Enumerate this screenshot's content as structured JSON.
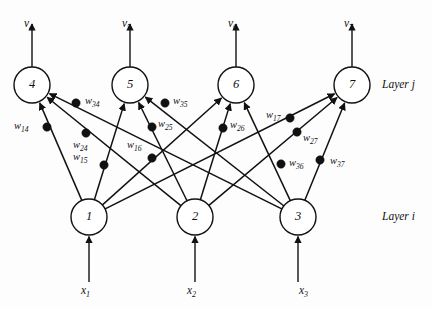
{
  "diagram": {
    "layers": [
      {
        "id": "layer-j",
        "label": "Layer j",
        "x": 382,
        "y": 78
      },
      {
        "id": "layer-i",
        "label": "Layer i",
        "x": 382,
        "y": 210
      }
    ],
    "nodes": [
      {
        "id": "n1",
        "label": "1",
        "cx": 89,
        "cy": 217,
        "r": 18,
        "layer": "i"
      },
      {
        "id": "n2",
        "label": "2",
        "cx": 195,
        "cy": 217,
        "r": 18,
        "layer": "i"
      },
      {
        "id": "n3",
        "label": "3",
        "cx": 298,
        "cy": 217,
        "r": 18,
        "layer": "i"
      },
      {
        "id": "n4",
        "label": "4",
        "cx": 32,
        "cy": 85,
        "r": 18,
        "layer": "j"
      },
      {
        "id": "n5",
        "label": "5",
        "cx": 130,
        "cy": 85,
        "r": 18,
        "layer": "j"
      },
      {
        "id": "n6",
        "label": "6",
        "cx": 236,
        "cy": 85,
        "r": 18,
        "layer": "j"
      },
      {
        "id": "n7",
        "label": "7",
        "cx": 352,
        "cy": 85,
        "r": 18,
        "layer": "j"
      }
    ],
    "inputs": [
      {
        "id": "x1",
        "base": "x",
        "sub": "1",
        "node": "n1",
        "x": 89,
        "label_y": 285,
        "line_from_y": 282,
        "line_to_y": 238
      },
      {
        "id": "x2",
        "base": "x",
        "sub": "2",
        "node": "n2",
        "x": 195,
        "label_y": 285,
        "line_from_y": 282,
        "line_to_y": 238
      },
      {
        "id": "x3",
        "base": "x",
        "sub": "3",
        "node": "n3",
        "x": 307,
        "label_y": 285,
        "line_from_y": 282,
        "line_to_y": 238
      }
    ],
    "outputs": [
      {
        "id": "v4",
        "base": "v",
        "sub": "4",
        "node": "n4",
        "x": 32,
        "label_y": 18,
        "line_from_y": 66,
        "line_to_y": 24
      },
      {
        "id": "v5",
        "base": "v",
        "sub": "5",
        "node": "n5",
        "x": 130,
        "label_y": 18,
        "line_from_y": 66,
        "line_to_y": 24
      },
      {
        "id": "v6",
        "base": "v",
        "sub": "6",
        "node": "n6",
        "x": 236,
        "label_y": 18,
        "line_from_y": 66,
        "line_to_y": 24
      },
      {
        "id": "v7",
        "base": "v",
        "sub": "7",
        "node": "n7",
        "x": 352,
        "label_y": 18,
        "line_from_y": 66,
        "line_to_y": 24
      }
    ],
    "edges": [
      {
        "id": "e14",
        "from": "n1",
        "to": "n4",
        "weight": "w14",
        "base": "w",
        "sub": "14",
        "dot_x": 47,
        "dot_y": 127,
        "label_x": 14,
        "label_y": 121
      },
      {
        "id": "e24",
        "from": "n2",
        "to": "n4",
        "weight": "w24",
        "base": "w",
        "sub": "24",
        "dot_x": 86,
        "dot_y": 133,
        "label_x": 73,
        "label_y": 140
      },
      {
        "id": "e34",
        "from": "n3",
        "to": "n4",
        "weight": "w34",
        "base": "w",
        "sub": "34",
        "dot_x": 76,
        "dot_y": 103,
        "label_x": 85,
        "label_y": 96
      },
      {
        "id": "e15",
        "from": "n1",
        "to": "n5",
        "weight": "w15",
        "base": "w",
        "sub": "15",
        "dot_x": 104,
        "dot_y": 165,
        "label_x": 73,
        "label_y": 152
      },
      {
        "id": "e25",
        "from": "n2",
        "to": "n5",
        "weight": "w25",
        "base": "w",
        "sub": "25",
        "dot_x": 152,
        "dot_y": 127,
        "label_x": 158,
        "label_y": 119
      },
      {
        "id": "e35",
        "from": "n3",
        "to": "n5",
        "weight": "w35",
        "base": "w",
        "sub": "35",
        "dot_x": 165,
        "dot_y": 103,
        "label_x": 173,
        "label_y": 96
      },
      {
        "id": "e16",
        "from": "n1",
        "to": "n6",
        "weight": "w16",
        "base": "w",
        "sub": "16",
        "dot_x": 152,
        "dot_y": 158,
        "label_x": 127,
        "label_y": 140
      },
      {
        "id": "e26",
        "from": "n2",
        "to": "n6",
        "weight": "w26",
        "base": "w",
        "sub": "26",
        "dot_x": 223,
        "dot_y": 128,
        "label_x": 230,
        "label_y": 120
      },
      {
        "id": "e36",
        "from": "n3",
        "to": "n6",
        "weight": "w36",
        "base": "w",
        "sub": "36",
        "dot_x": 281,
        "dot_y": 164,
        "label_x": 289,
        "label_y": 158
      },
      {
        "id": "e17",
        "from": "n1",
        "to": "n7",
        "weight": "w17",
        "base": "w",
        "sub": "17",
        "dot_x": 290,
        "dot_y": 118,
        "label_x": 266,
        "label_y": 110
      },
      {
        "id": "e27",
        "from": "n2",
        "to": "n7",
        "weight": "w27",
        "base": "w",
        "sub": "27",
        "dot_x": 297,
        "dot_y": 132,
        "label_x": 303,
        "label_y": 133
      },
      {
        "id": "e37",
        "from": "n3",
        "to": "n7",
        "weight": "w37",
        "base": "w",
        "sub": "37",
        "dot_x": 320,
        "dot_y": 160,
        "label_x": 330,
        "label_y": 156
      }
    ]
  }
}
